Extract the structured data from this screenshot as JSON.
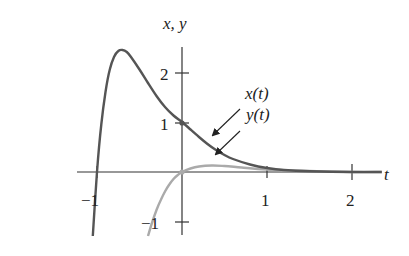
{
  "chart_data": {
    "type": "line",
    "title": "",
    "xlabel": "t",
    "ylabel": "x, y",
    "xlim": [
      -1.05,
      2.35
    ],
    "ylim": [
      -1.3,
      2.8
    ],
    "grid": false,
    "legend_position": "annotations with arrows",
    "x_ticks": [
      -1,
      1,
      2
    ],
    "y_ticks": [
      -1,
      1,
      2
    ],
    "x_tick_labels": [
      "−1",
      "1",
      "2"
    ],
    "y_tick_labels": [
      "−1",
      "1",
      "2"
    ],
    "series": [
      {
        "name": "x(t)",
        "color": "#555555",
        "t": [
          -1.05,
          -1.0,
          -0.95,
          -0.9,
          -0.85,
          -0.8,
          -0.75,
          -0.7,
          -0.65,
          -0.6,
          -0.5,
          -0.4,
          -0.3,
          -0.2,
          -0.1,
          0.0,
          0.1,
          0.2,
          0.3,
          0.4,
          0.5,
          0.6,
          0.8,
          1.0,
          1.2,
          1.5,
          2.0,
          2.35
        ],
        "values": [
          -1.28,
          0.0,
          0.95,
          1.6,
          2.05,
          2.3,
          2.42,
          2.44,
          2.4,
          2.3,
          2.05,
          1.78,
          1.52,
          1.3,
          1.13,
          1.0,
          0.85,
          0.7,
          0.56,
          0.44,
          0.34,
          0.26,
          0.15,
          0.08,
          0.04,
          0.015,
          0.0,
          0.0
        ]
      },
      {
        "name": "y(t)",
        "color": "#aaaaaa",
        "t": [
          -0.4,
          -0.35,
          -0.3,
          -0.25,
          -0.2,
          -0.15,
          -0.1,
          -0.05,
          0.0,
          0.1,
          0.2,
          0.35,
          0.5,
          0.7,
          1.0,
          1.5,
          2.0,
          2.35
        ],
        "values": [
          -1.28,
          -1.0,
          -0.76,
          -0.56,
          -0.39,
          -0.25,
          -0.14,
          -0.06,
          0.0,
          0.07,
          0.11,
          0.13,
          0.12,
          0.09,
          0.05,
          0.02,
          0.0,
          0.0
        ]
      }
    ],
    "annotations": [
      {
        "text": "x(t)",
        "arrow_to": [
          0.35,
          0.52
        ]
      },
      {
        "text": "y(t)",
        "arrow_to": [
          0.4,
          0.13
        ]
      }
    ]
  },
  "labels": {
    "yaxis": "x, y",
    "xaxis": "t",
    "x_minus1": "−1",
    "x_1": "1",
    "x_2": "2",
    "y_2": "2",
    "y_1": "1",
    "y_minus1": "−1",
    "ann_x": "x(t)",
    "ann_y": "y(t)"
  }
}
